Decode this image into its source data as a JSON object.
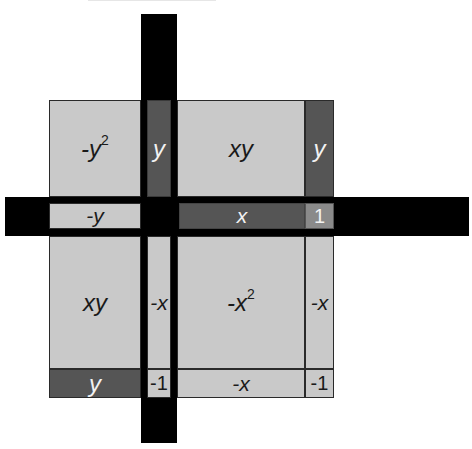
{
  "diagram": {
    "colors": {
      "bar": "#000000",
      "light_tile": "#c9c9c9",
      "dark_tile": "#555555",
      "unit_tile_positive": "#8a8a8a",
      "background": "#ffffff"
    },
    "rows": [
      {
        "name": "top-row",
        "cells": [
          {
            "label": "-y",
            "sup": "2",
            "shade": "light"
          },
          {
            "label": "y",
            "shade": "dark"
          },
          {
            "label": "xy",
            "shade": "light"
          },
          {
            "label": "y",
            "shade": "dark"
          }
        ]
      },
      {
        "name": "strip-row",
        "cells": [
          {
            "label": "-y",
            "shade": "light"
          },
          {
            "label": "",
            "shade": "black"
          },
          {
            "label": "x",
            "shade": "dark"
          },
          {
            "label": "1",
            "shade": "mid"
          }
        ]
      },
      {
        "name": "middle-row",
        "cells": [
          {
            "label": "xy",
            "shade": "light"
          },
          {
            "label": "-x",
            "shade": "light"
          },
          {
            "label": "-x",
            "sup": "2",
            "shade": "light"
          },
          {
            "label": "-x",
            "shade": "light"
          }
        ]
      },
      {
        "name": "bottom-row",
        "cells": [
          {
            "label": "y",
            "shade": "dark"
          },
          {
            "label": "-1",
            "shade": "light"
          },
          {
            "label": "-x",
            "shade": "light"
          },
          {
            "label": "-1",
            "shade": "light"
          }
        ]
      }
    ]
  }
}
